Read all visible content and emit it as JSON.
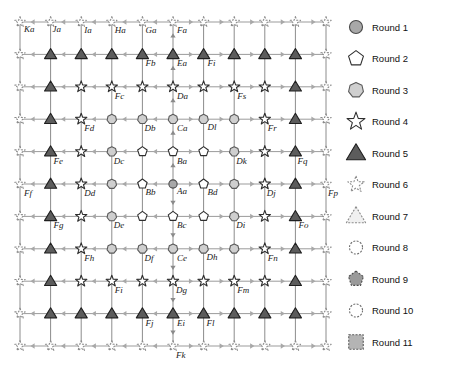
{
  "figure": {
    "type": "diagram",
    "grid": {
      "rows": 11,
      "cols": 11,
      "origin_x": 20,
      "origin_y": 22,
      "step_x": 30.6,
      "step_y": 32.4
    }
  },
  "legend": {
    "x": 372,
    "icon_x": 356,
    "start_y": 27,
    "step_y": 31.5,
    "items": [
      {
        "label": "Round 1",
        "shape": "circle",
        "fill": "#a8a8a8",
        "stroke": "#4a4a4a",
        "dashed": false,
        "size": 9
      },
      {
        "label": "Round 2",
        "shape": "pentagon",
        "fill": "#ffffff",
        "stroke": "#2e2e2e",
        "dashed": false,
        "size": 10
      },
      {
        "label": "Round 3",
        "shape": "heptagon",
        "fill": "#cfcfcf",
        "stroke": "#5a5a5a",
        "dashed": false,
        "size": 10
      },
      {
        "label": "Round 4",
        "shape": "star",
        "fill": "#ffffff",
        "stroke": "#2e2e2e",
        "dashed": false,
        "size": 11
      },
      {
        "label": "Round 5",
        "shape": "triangle",
        "fill": "#5c5c5c",
        "stroke": "#1f1f1f",
        "dashed": false,
        "size": 11
      },
      {
        "label": "Round 6",
        "shape": "star",
        "fill": "#ffffff",
        "stroke": "#8a8a8a",
        "dashed": true,
        "size": 10
      },
      {
        "label": "Round 7",
        "shape": "triangle",
        "fill": "#f0f0f0",
        "stroke": "#8a8a8a",
        "dashed": true,
        "size": 11
      },
      {
        "label": "Round 8",
        "shape": "circle",
        "fill": "#ffffff",
        "stroke": "#6f6f6f",
        "dashed": true,
        "size": 9
      },
      {
        "label": "Round 9",
        "shape": "pentagon",
        "fill": "#9a9a9a",
        "stroke": "#4a4a4a",
        "dashed": true,
        "size": 10
      },
      {
        "label": "Round 10",
        "shape": "circle",
        "fill": "#ffffff",
        "stroke": "#6f6f6f",
        "dashed": true,
        "size": 9
      },
      {
        "label": "Round 11",
        "shape": "square",
        "fill": "#b4b4b4",
        "stroke": "#5a5a5a",
        "dashed": true,
        "size": 10
      }
    ]
  },
  "ring_to_round": [
    1,
    2,
    3,
    4,
    5,
    6,
    7,
    8,
    9,
    10,
    11
  ],
  "node_labels": [
    {
      "id": "Ka",
      "col": 0,
      "row": 0,
      "dx": 4,
      "dy": 10
    },
    {
      "id": "Ja",
      "col": 1,
      "row": 0,
      "dx": 2,
      "dy": 10
    },
    {
      "id": "Ia",
      "col": 2,
      "row": 0,
      "dx": 3,
      "dy": 11
    },
    {
      "id": "Ha",
      "col": 3,
      "row": 0,
      "dx": 3,
      "dy": 11
    },
    {
      "id": "Ga",
      "col": 4,
      "row": 0,
      "dx": 3,
      "dy": 11
    },
    {
      "id": "Fa",
      "col": 5,
      "row": 0,
      "dx": 4,
      "dy": 11
    },
    {
      "id": "Fb",
      "col": 4,
      "row": 1,
      "dx": 3,
      "dy": 12
    },
    {
      "id": "Ea",
      "col": 5,
      "row": 1,
      "dx": 4,
      "dy": 12
    },
    {
      "id": "Fi",
      "col": 6,
      "row": 1,
      "dx": 4,
      "dy": 12
    },
    {
      "id": "Fc",
      "col": 3,
      "row": 2,
      "dx": 3,
      "dy": 12
    },
    {
      "id": "Da",
      "col": 5,
      "row": 2,
      "dx": 4,
      "dy": 12
    },
    {
      "id": "Fs",
      "col": 7,
      "row": 2,
      "dx": 3,
      "dy": 12
    },
    {
      "id": "Fd",
      "col": 2,
      "row": 3,
      "dx": 3,
      "dy": 12
    },
    {
      "id": "Db",
      "col": 4,
      "row": 3,
      "dx": 2,
      "dy": 12
    },
    {
      "id": "Ca",
      "col": 5,
      "row": 3,
      "dx": 4,
      "dy": 12
    },
    {
      "id": "Dl",
      "col": 6,
      "row": 3,
      "dx": 4,
      "dy": 11
    },
    {
      "id": "Fr",
      "col": 8,
      "row": 3,
      "dx": 3,
      "dy": 12
    },
    {
      "id": "Fe",
      "col": 1,
      "row": 4,
      "dx": 3,
      "dy": 12
    },
    {
      "id": "Dc",
      "col": 3,
      "row": 4,
      "dx": 2,
      "dy": 12
    },
    {
      "id": "Ba",
      "col": 5,
      "row": 4,
      "dx": 4,
      "dy": 12
    },
    {
      "id": "Dk",
      "col": 7,
      "row": 4,
      "dx": 2,
      "dy": 12
    },
    {
      "id": "Fq",
      "col": 9,
      "row": 4,
      "dx": 2,
      "dy": 12
    },
    {
      "id": "Ff",
      "col": 0,
      "row": 5,
      "dx": 4,
      "dy": 12
    },
    {
      "id": "Dd",
      "col": 2,
      "row": 5,
      "dx": 3,
      "dy": 12
    },
    {
      "id": "Bb",
      "col": 4,
      "row": 5,
      "dx": 3,
      "dy": 11
    },
    {
      "id": "Aa",
      "col": 5,
      "row": 5,
      "dx": 4,
      "dy": 10
    },
    {
      "id": "Bd",
      "col": 6,
      "row": 5,
      "dx": 4,
      "dy": 11
    },
    {
      "id": "Dj",
      "col": 8,
      "row": 5,
      "dx": 2,
      "dy": 12
    },
    {
      "id": "Fp",
      "col": 10,
      "row": 5,
      "dx": 2,
      "dy": 12
    },
    {
      "id": "Fg",
      "col": 1,
      "row": 6,
      "dx": 3,
      "dy": 12
    },
    {
      "id": "De",
      "col": 3,
      "row": 6,
      "dx": 2,
      "dy": 12
    },
    {
      "id": "Bc",
      "col": 5,
      "row": 6,
      "dx": 4,
      "dy": 12
    },
    {
      "id": "Di",
      "col": 7,
      "row": 6,
      "dx": 2,
      "dy": 12
    },
    {
      "id": "Fo",
      "col": 9,
      "row": 6,
      "dx": 3,
      "dy": 12
    },
    {
      "id": "Fh",
      "col": 2,
      "row": 7,
      "dx": 3,
      "dy": 12
    },
    {
      "id": "Df",
      "col": 4,
      "row": 7,
      "dx": 2,
      "dy": 12
    },
    {
      "id": "Ce",
      "col": 5,
      "row": 7,
      "dx": 4,
      "dy": 12
    },
    {
      "id": "Dh",
      "col": 6,
      "row": 7,
      "dx": 3,
      "dy": 11
    },
    {
      "id": "Fn",
      "col": 8,
      "row": 7,
      "dx": 3,
      "dy": 12
    },
    {
      "id": "Fi2",
      "col": 3,
      "row": 8,
      "dx": 3,
      "dy": 12,
      "text": "Fi"
    },
    {
      "id": "Dg",
      "col": 5,
      "row": 8,
      "dx": 3,
      "dy": 12
    },
    {
      "id": "Fm",
      "col": 7,
      "row": 8,
      "dx": 3,
      "dy": 12
    },
    {
      "id": "Fj",
      "col": 4,
      "row": 9,
      "dx": 3,
      "dy": 12
    },
    {
      "id": "Ei",
      "col": 5,
      "row": 9,
      "dx": 4,
      "dy": 12
    },
    {
      "id": "Fl",
      "col": 6,
      "row": 9,
      "dx": 3,
      "dy": 12
    },
    {
      "id": "Fk",
      "col": 5,
      "row": 10,
      "dx": 3,
      "dy": 12
    }
  ],
  "colors": {
    "edge": "#9b9b9b",
    "arrow": "#a8a8a8",
    "label": "#1a1a1a",
    "background": "#ffffff"
  }
}
